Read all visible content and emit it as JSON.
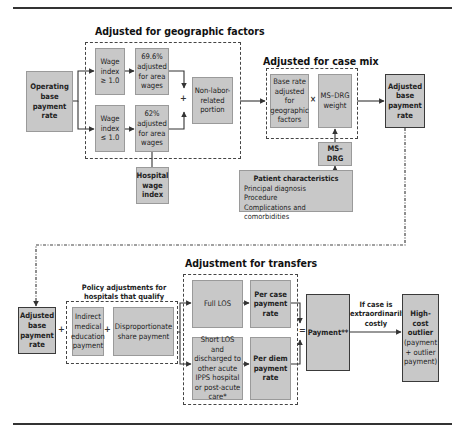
{
  "diagram": {
    "geographic": {
      "title": "Adjusted for geographic factors",
      "operating_base": "Operating base payment rate",
      "wage_index_high": "Wage index ≥ 1.0",
      "wage_index_low": "Wage index ≤ 1.0",
      "adjusted_high": "69.6% adjusted for area wages",
      "adjusted_low": "62% adjusted for area wages",
      "non_labor": "Non-labor-related portion",
      "hospital_wage_index": "Hospital wage index",
      "plus": "+"
    },
    "case_mix": {
      "title": "Adjusted for case mix",
      "base_rate": "Base rate adjusted for geographic factors",
      "times": "×",
      "ms_drg_weight": "MS–DRG weight",
      "ms_drg": "MS–DRG",
      "adjusted_base": "Adjusted base payment rate"
    },
    "patient": {
      "heading": "Patient characteristics",
      "items": [
        "Principal diagnosis",
        "Procedure",
        "Complications and comorbidities"
      ]
    },
    "policy": {
      "title": "Policy adjustments for hospitals that qualify",
      "adjusted_base": "Adjusted base payment rate",
      "plus1": "+",
      "ime": "Indirect medical education payment",
      "plus2": "+",
      "dsh": "Disproportionate share payment"
    },
    "transfers": {
      "title": "Adjustment for transfers",
      "full_los": "Full LOS",
      "per_case": "Per case payment rate",
      "short_los": "Short LOS and discharged to other acute IPPS hospital or post-acute care*",
      "per_diem": "Per diem payment rate",
      "equals": "="
    },
    "payment": {
      "label": "Payment**",
      "condition": "If case is extraordinarily costly",
      "outlier_bold": "High-cost outlier",
      "outlier_rest": "(payment + outlier payment)"
    }
  },
  "colors": {
    "box_fill": "#c8c8c8",
    "box_border": "#9a9a9a",
    "strong_border": "#3a3a3a",
    "line": "#333333"
  }
}
